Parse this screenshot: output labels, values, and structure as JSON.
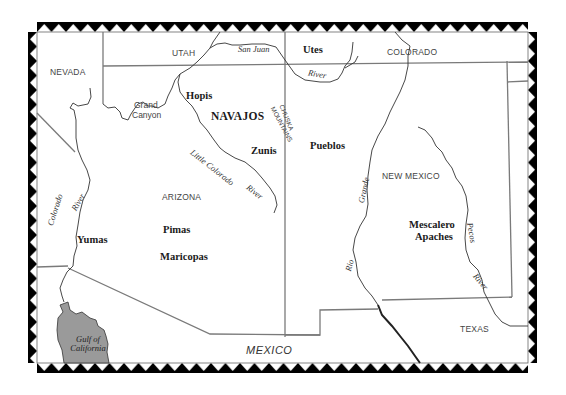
{
  "map": {
    "states": {
      "nevada": "NEVADA",
      "utah": "UTAH",
      "colorado": "COLORADO",
      "arizona": "ARIZONA",
      "new_mexico": "NEW MEXICO",
      "texas": "TEXAS"
    },
    "country": "MEXICO",
    "water": {
      "gulf_line1": "Gulf of",
      "gulf_line2": "California"
    },
    "tribes": {
      "utes": "Utes",
      "hopis": "Hopis",
      "navajos": "NAVAJOS",
      "zunis": "Zunis",
      "pueblos": "Pueblos",
      "yumas": "Yumas",
      "pimas": "Pimas",
      "maricopas": "Maricopas",
      "mescalero_1": "Mescalero",
      "mescalero_2": "Apaches"
    },
    "rivers": {
      "san_juan": "San Juan",
      "san_juan_river": "River",
      "colorado": "Colorado",
      "colorado_river": "River",
      "little_colorado": "Little Colorado",
      "little_colorado_river": "River",
      "rio": "Rio",
      "grande": "Grande",
      "pecos": "Pecos",
      "pecos_river": "River"
    },
    "places": {
      "grand_1": "Grand",
      "grand_2": "Canyon",
      "chuska_1": "CHUSKA",
      "chuska_2": "MOUNTAINS"
    },
    "colors": {
      "border": "#000000",
      "state_line": "#7a7a7a",
      "river": "#333333",
      "gulf_fill": "#9a9a9a"
    }
  }
}
